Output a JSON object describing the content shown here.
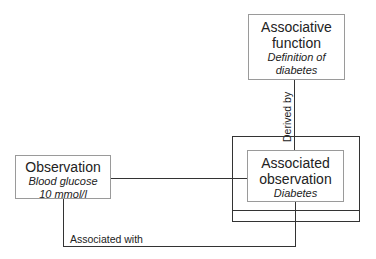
{
  "nodes": {
    "associative_function": {
      "title_line1": "Associative",
      "title_line2": "function",
      "sub_line1": "Definition of",
      "sub_line2": "diabetes"
    },
    "observation": {
      "title": "Observation",
      "sub_line1": "Blood glucose",
      "sub_line2": "10 mmol/l"
    },
    "associated_observation": {
      "title_line1": "Associated",
      "title_line2": "observation",
      "sub": "Diabetes"
    }
  },
  "edges": {
    "derived_by": "Derived by",
    "associated_with": "Associated with"
  }
}
